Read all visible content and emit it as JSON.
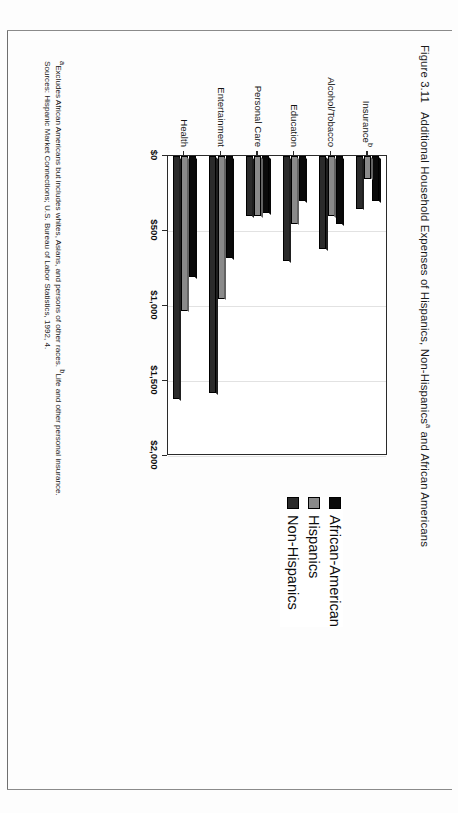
{
  "figure": {
    "number": "Figure 3.11",
    "title_part1": "Additional Household Expenses of Hispanics, Non-Hispanics",
    "title_sup": "a",
    "title_part2": " and African Americans"
  },
  "legend": {
    "items": [
      {
        "label": "African-American",
        "color": "#0a0a0a"
      },
      {
        "label": "Hispanics",
        "color": "#8a8a8a"
      },
      {
        "label": "Non-Hispanics",
        "color": "#2b2b2b"
      }
    ]
  },
  "notes": {
    "line1_sup": "a",
    "line1_a": "Excludes African Americans but includes whites, Asians, and persons of other races. ",
    "line1_sup2": "b",
    "line1_b": "Life and other personal insurance.",
    "line2": "Sources: Hispanic Market Connections; U.S. Bureau of Labor Statistics, 1992, 4."
  },
  "chart_data": {
    "type": "bar",
    "orientation": "horizontal",
    "xlabel": "",
    "ylabel": "",
    "xlim": [
      0,
      2000
    ],
    "ticks": [
      "$0",
      "$500",
      "$1,000",
      "$1,500",
      "$2,000"
    ],
    "tick_values": [
      0,
      500,
      1000,
      1500,
      2000
    ],
    "grid": true,
    "legend_position": "right",
    "categories": [
      "Insuranceᵇ",
      "Alcohol/Tobacco",
      "Education",
      "Personal Care",
      "Entertainment",
      "Health"
    ],
    "category_labels": [
      {
        "text": "Insurance",
        "sup": "b"
      },
      {
        "text": "Alcohol/Tobacco",
        "sup": ""
      },
      {
        "text": "Education",
        "sup": ""
      },
      {
        "text": "Personal Care",
        "sup": ""
      },
      {
        "text": "Entertainment",
        "sup": ""
      },
      {
        "text": "Health",
        "sup": ""
      }
    ],
    "series": [
      {
        "name": "African-American",
        "color": "#0a0a0a",
        "values": [
          300,
          455,
          300,
          380,
          680,
          805
        ]
      },
      {
        "name": "Hispanics",
        "color": "#8a8a8a",
        "values": [
          150,
          400,
          450,
          400,
          950,
          1030
        ]
      },
      {
        "name": "Non-Hispanics",
        "color": "#2b2b2b",
        "values": [
          350,
          620,
          700,
          400,
          1580,
          1620
        ]
      }
    ]
  }
}
